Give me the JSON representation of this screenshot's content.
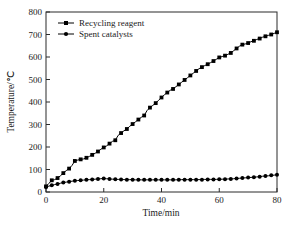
{
  "chart_data": {
    "type": "line",
    "title": "",
    "xlabel": "Time/min",
    "ylabel": "Temperature/℃",
    "xlim": [
      0,
      80
    ],
    "ylim": [
      0,
      800
    ],
    "xticks": [
      0,
      20,
      40,
      60,
      80
    ],
    "yticks": [
      0,
      100,
      200,
      300,
      400,
      500,
      600,
      700,
      800
    ],
    "grid": false,
    "legend_position": "top-left",
    "series": [
      {
        "name": "Recycling reagent",
        "marker": "square",
        "color": "#000000",
        "x": [
          0,
          1,
          2,
          3,
          4,
          5,
          6,
          7,
          8,
          9,
          10,
          11,
          12,
          13,
          14,
          15,
          16,
          17,
          18,
          19,
          20,
          21,
          22,
          23,
          24,
          25,
          26,
          27,
          28,
          29,
          30,
          31,
          32,
          33,
          34,
          35,
          36,
          37,
          38,
          39,
          40,
          41,
          42,
          43,
          44,
          45,
          46,
          47,
          48,
          49,
          50,
          51,
          52,
          53,
          54,
          55,
          56,
          57,
          58,
          59,
          60,
          61,
          62,
          63,
          64,
          65,
          66,
          67,
          68,
          69,
          70,
          71,
          72,
          73,
          74,
          75,
          76,
          77,
          78,
          79,
          80
        ],
        "y": [
          25,
          38,
          52,
          55,
          62,
          72,
          84,
          95,
          104,
          118,
          138,
          142,
          145,
          147,
          152,
          158,
          165,
          172,
          180,
          190,
          198,
          205,
          215,
          225,
          230,
          252,
          262,
          272,
          280,
          292,
          302,
          312,
          322,
          332,
          340,
          362,
          375,
          385,
          395,
          408,
          420,
          432,
          442,
          452,
          458,
          468,
          478,
          488,
          498,
          508,
          518,
          528,
          538,
          548,
          555,
          562,
          568,
          575,
          582,
          590,
          598,
          602,
          606,
          612,
          618,
          628,
          638,
          648,
          655,
          658,
          662,
          668,
          672,
          678,
          682,
          688,
          692,
          696,
          700,
          705,
          710
        ]
      },
      {
        "name": "Spent catalysts",
        "marker": "circle",
        "color": "#000000",
        "x": [
          0,
          1,
          2,
          3,
          4,
          5,
          6,
          7,
          8,
          9,
          10,
          11,
          12,
          13,
          14,
          15,
          16,
          17,
          18,
          19,
          20,
          21,
          22,
          23,
          24,
          25,
          26,
          27,
          28,
          29,
          30,
          31,
          32,
          33,
          34,
          35,
          36,
          37,
          38,
          39,
          40,
          41,
          42,
          43,
          44,
          45,
          46,
          47,
          48,
          49,
          50,
          51,
          52,
          53,
          54,
          55,
          56,
          57,
          58,
          59,
          60,
          61,
          62,
          63,
          64,
          65,
          66,
          67,
          68,
          69,
          70,
          71,
          72,
          73,
          74,
          75,
          76,
          77,
          78,
          79,
          80
        ],
        "y": [
          22,
          26,
          30,
          33,
          36,
          39,
          42,
          44,
          46,
          48,
          50,
          51,
          52,
          53,
          54,
          55,
          56,
          57,
          58,
          59,
          60,
          59,
          58,
          57,
          57,
          56,
          56,
          55,
          55,
          55,
          55,
          54,
          54,
          54,
          54,
          54,
          54,
          54,
          54,
          54,
          54,
          54,
          54,
          54,
          54,
          54,
          55,
          55,
          55,
          55,
          55,
          55,
          55,
          55,
          55,
          56,
          56,
          56,
          56,
          56,
          57,
          57,
          57,
          58,
          58,
          59,
          60,
          61,
          62,
          63,
          64,
          65,
          66,
          67,
          68,
          70,
          71,
          72,
          74,
          75,
          77
        ]
      }
    ]
  },
  "legend": {
    "entries": [
      {
        "label": "Recycling reagent",
        "marker": "square"
      },
      {
        "label": "Spent catalysts",
        "marker": "circle"
      }
    ]
  },
  "axes": {
    "x_title": "Time/min",
    "y_title": "Temperature/℃",
    "x_tick_labels": [
      "0",
      "20",
      "40",
      "60",
      "80"
    ],
    "y_tick_labels": [
      "0",
      "100",
      "200",
      "300",
      "400",
      "500",
      "600",
      "700",
      "800"
    ]
  },
  "colors": {
    "ink": "#1a1a1a",
    "series": "#000000",
    "background": "#ffffff"
  }
}
